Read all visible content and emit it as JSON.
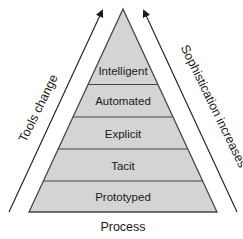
{
  "diagram": {
    "type": "pyramid",
    "levels": [
      {
        "label": "Intelligent"
      },
      {
        "label": "Automated"
      },
      {
        "label": "Explicit"
      },
      {
        "label": "Tacit"
      },
      {
        "label": "Prototyped"
      }
    ],
    "left_arrow_label": "Tools change",
    "right_arrow_label": "Sophistication increases",
    "base_label": "Process",
    "colors": {
      "fill": "#d4d4d4",
      "stroke": "#444444",
      "text": "#1a1a1a"
    }
  }
}
